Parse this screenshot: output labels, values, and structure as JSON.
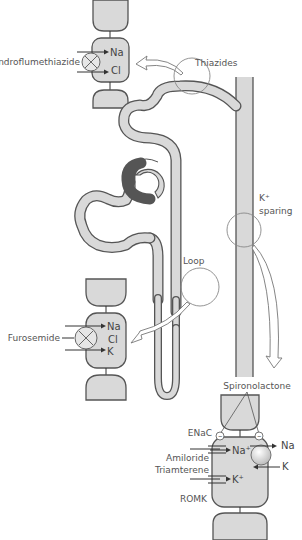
{
  "diagram": {
    "sites": {
      "thiazides": {
        "label": "Thiazides"
      },
      "loop": {
        "label": "Loop"
      },
      "k_sparing": {
        "label_line1": "K⁺",
        "label_line2": "sparing"
      }
    },
    "thiazide_cell": {
      "drug": "Bendroflumethiazide",
      "ions": [
        "Na",
        "Cl"
      ]
    },
    "loop_cell": {
      "drug": "Furosemide",
      "ions": [
        "Na",
        "Cl",
        "K"
      ]
    },
    "k_sparing_cell": {
      "drug_top": "Spironolactone",
      "channel_top": "ENaC",
      "drug_left_1": "Amiloride",
      "drug_left_2": "Triamterene",
      "channel_bottom": "ROMK",
      "ions_in": [
        "Na⁺",
        "K⁺"
      ],
      "pump_ions": [
        "Na",
        "K"
      ],
      "receptor_symbol": "−"
    },
    "colors": {
      "tubule_fill": "#d9d9d9",
      "outline": "#555555",
      "text": "#555555"
    }
  }
}
